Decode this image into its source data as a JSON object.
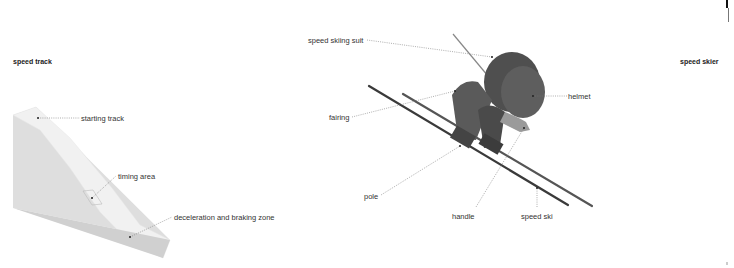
{
  "left_panel": {
    "title": "speed track",
    "labels": {
      "starting_track": "starting track",
      "timing_area": "timing area",
      "deceleration_zone": "deceleration and braking zone"
    }
  },
  "center_panel": {
    "labels": {
      "suit": "speed skiing suit",
      "helmet": "helmet",
      "fairing": "fairing",
      "pole": "pole",
      "handle": "handle",
      "speed_ski": "speed ski"
    }
  },
  "right_panel": {
    "title": "speed skier"
  },
  "colors": {
    "background": "#ffffff",
    "track_face": "#e2e2e2",
    "track_top": "#f3f3f3",
    "skier_dark": "#4a4a4a",
    "leader_line": "#666666"
  }
}
